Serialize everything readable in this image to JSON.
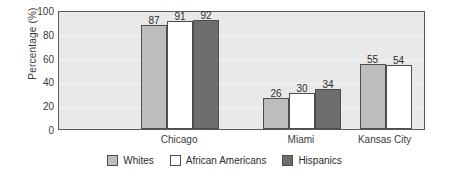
{
  "chart_data": {
    "type": "bar",
    "title": "",
    "xlabel": "",
    "ylabel": "Percentage (%)",
    "categories": [
      "Chicago",
      "Miami",
      "Kansas City"
    ],
    "series": [
      {
        "name": "Whites",
        "color": "#bdbdbd",
        "values": [
          87,
          26,
          55
        ]
      },
      {
        "name": "African Americans",
        "color": "#ffffff",
        "values": [
          91,
          30,
          54
        ]
      },
      {
        "name": "Hispanics",
        "color": "#6e6e6e",
        "values": [
          92,
          34,
          null
        ]
      }
    ],
    "ylim": [
      0,
      100
    ],
    "yticks": [
      0,
      20,
      40,
      60,
      80,
      100
    ],
    "grid": true,
    "legend_position": "bottom",
    "plot_background": "#e9e9e9",
    "axis_color": "#5a5a5a",
    "bar_border_color": "#4d4d4d",
    "value_labels": true
  },
  "layout": {
    "group_centers_pct": [
      33.0,
      66.2,
      89.0
    ],
    "bar_width_px": 26,
    "bar_gap_px": 0
  }
}
